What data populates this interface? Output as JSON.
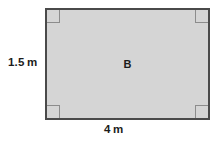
{
  "figure": {
    "type": "geometry-diagram",
    "shape": "rectangle",
    "interior_label": "B",
    "fill_color": "#d5d5d5",
    "outline_color": "#4a4a4a",
    "corner_mark_color": "#8c8c8c",
    "background_color": "#ffffff",
    "right_angle_marks": 4
  },
  "dimensions": {
    "height": {
      "value": "1.5",
      "unit": "m",
      "position": "left"
    },
    "width": {
      "value": "4",
      "unit": "m",
      "position": "bottom"
    }
  },
  "icons": {
    "right_angle_top_left": "right-angle-mark",
    "right_angle_top_right": "right-angle-mark",
    "right_angle_bottom_left": "right-angle-mark",
    "right_angle_bottom_right": "right-angle-mark"
  }
}
